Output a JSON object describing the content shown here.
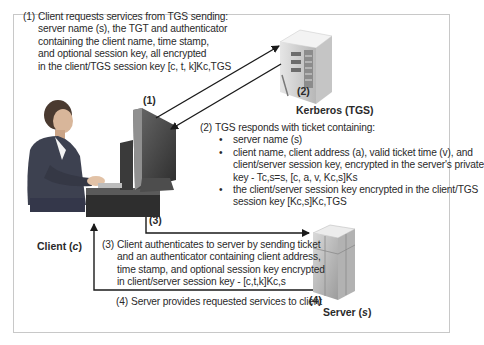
{
  "diagram": {
    "type": "kerberos-ticket-granting-flow",
    "nodes": {
      "client": {
        "label": "Client (c)",
        "label_main": "Client (",
        "label_var": "c",
        "label_end": ")"
      },
      "kerberos": {
        "label": "Kerberos (TGS)",
        "step": "(2)"
      },
      "server": {
        "label": "Server (s)",
        "label_main": "Server (",
        "label_var": "s",
        "label_end": ")",
        "step": "(4)"
      }
    },
    "step_markers": {
      "one": "(1)",
      "three": "(3)"
    },
    "steps": [
      {
        "num": "(1)",
        "lines": [
          "Client requests services from TGS sending:",
          "server name (s), the TGT and authenticator",
          "containing the client name, time stamp,",
          "and optional session key, all encrypted",
          "in the client/TGS session key [c, t, k]Kc,TGS"
        ]
      },
      {
        "num": "(2)",
        "intro": "TGS responds with ticket containing:",
        "bullets": [
          [
            "server name (s)"
          ],
          [
            "client name, client address (a), valid ticket time (v), and",
            "client/server session key, encrypted in the server's private",
            "key - Tc,s=s, [c, a, v, Kc,s]Ks"
          ],
          [
            "the client/server session key encrypted in the client/TGS",
            "session key [Kc,s]Kc,TGS"
          ]
        ]
      },
      {
        "num": "(3)",
        "lines": [
          "Client authenticates to server by sending ticket",
          "and an authenticator containing client address,",
          "time stamp, and optional session key encrypted",
          "in client/server session key - [c,t,k]Kc,s"
        ]
      },
      {
        "num": "(4)",
        "lines": [
          "Server provides requested services to client"
        ]
      }
    ],
    "edges": [
      {
        "from": "client",
        "to": "kerberos",
        "step": "(1)"
      },
      {
        "from": "kerberos",
        "to": "client",
        "step": "(2)"
      },
      {
        "from": "client",
        "to": "server",
        "step": "(3)"
      },
      {
        "from": "server",
        "to": "client",
        "step": "(4)"
      }
    ],
    "colors": {
      "frame": "#c8c8c8",
      "arrow": "#1a1a1a",
      "text": "#2a2a2a"
    }
  }
}
